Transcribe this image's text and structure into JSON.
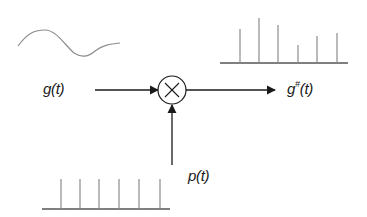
{
  "diagram": {
    "labels": {
      "input": "g(t)",
      "output_base": "g",
      "output_sup": "#",
      "output_tail": "(t)",
      "sampling": "p(t)"
    },
    "operator": {
      "symbol": "multiply",
      "glyph": "×"
    },
    "nodes": [
      {
        "id": "input-signal",
        "label": "g(t)",
        "shape": "continuous waveform"
      },
      {
        "id": "multiplier",
        "label": "×",
        "shape": "circle"
      },
      {
        "id": "sampling-train",
        "label": "p(t)",
        "shape": "uniform impulse train"
      },
      {
        "id": "output-signal",
        "label": "g#(t)",
        "shape": "sampled impulses"
      }
    ],
    "edges": [
      {
        "from": "input-signal",
        "to": "multiplier"
      },
      {
        "from": "sampling-train",
        "to": "multiplier"
      },
      {
        "from": "multiplier",
        "to": "output-signal"
      }
    ],
    "sampled_impulse_heights": [
      34,
      45,
      38,
      18,
      27,
      30
    ],
    "sampling_impulse_count": 6,
    "colors": {
      "arrow": "#1a1a1a",
      "waveform": "#8c8c8c",
      "impulse": "#8c8c8c",
      "baseline": "#555555"
    }
  }
}
